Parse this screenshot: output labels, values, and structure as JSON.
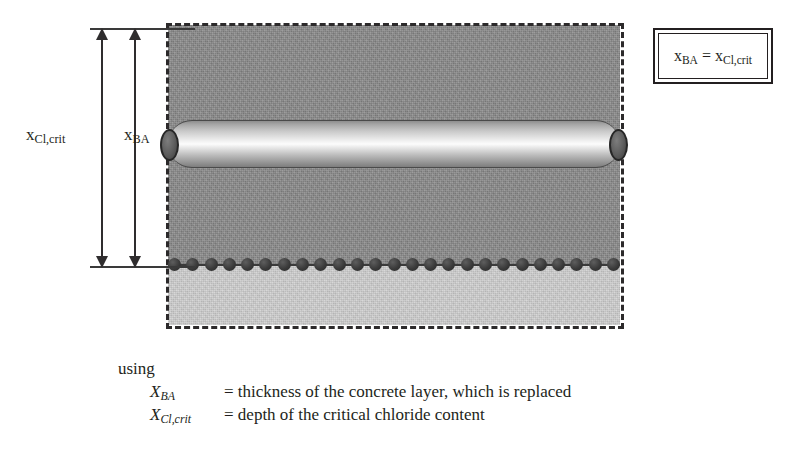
{
  "diagram": {
    "title_equation": {
      "symbol_left": "x",
      "sub_left": "BA",
      "operator": " = ",
      "symbol_right": "x",
      "sub_right": "Cl,crit"
    },
    "dimensions": [
      {
        "id": "x-cl-crit",
        "symbol": "x",
        "subscript": "Cl,crit",
        "meaning": "depth of the critical chloride content"
      },
      {
        "id": "x-ba",
        "symbol": "x",
        "subscript": "BA",
        "meaning": "thickness of the concrete layer, which is replaced"
      }
    ],
    "block": {
      "upper_zone_label": "chloride contaminated concrete",
      "lower_zone_label": "sound concrete",
      "upper_color": "#8d8d8d",
      "lower_color": "#d2d2d2",
      "outline_color": "#2c2a2b",
      "outline_style": "dashed"
    },
    "rebar": {
      "label": "reinforcement bar",
      "cap_color": "#3b3b3b",
      "highlight_color": "#fcfcfc"
    },
    "chloride_front": {
      "label": "critical chloride content front",
      "dot_count": 25,
      "dot_color": "#3a3a3a"
    }
  },
  "caption": {
    "using": "using",
    "entries": [
      {
        "symbol": "X",
        "subscript": "BA",
        "equals": "=",
        "description": "thickness of the concrete layer, which is replaced"
      },
      {
        "symbol": "X",
        "subscript": "Cl,crit",
        "equals": "=",
        "description": "depth of the critical chloride content"
      }
    ]
  }
}
